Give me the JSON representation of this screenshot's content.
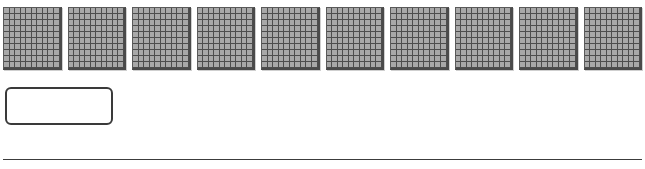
{
  "worksheet": {
    "manipulative": {
      "type": "base-ten-hundred-flat",
      "block_count": 10,
      "grid_rows": 10,
      "grid_cols": 10,
      "fill_color": "#a8a8a8",
      "line_color": "#4d4d4d"
    },
    "answer_box": {
      "value": "",
      "placeholder": ""
    },
    "colors": {
      "background": "#ffffff",
      "outline": "#3a3a3a"
    }
  }
}
